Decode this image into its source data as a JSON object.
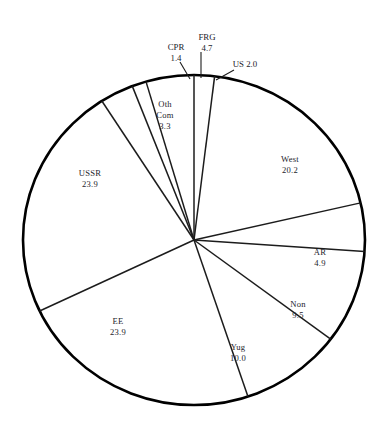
{
  "chart_data": {
    "type": "pie",
    "title": "",
    "subtitle": "",
    "xlabel": "",
    "ylabel": "",
    "units": "percent",
    "legend_position": "none",
    "grid": false,
    "start_angle_deg": 0,
    "direction": "clockwise",
    "categories": [
      "US",
      "West",
      "AR",
      "Non",
      "Yug",
      "EE",
      "USSR",
      "Oth Com",
      "CPR",
      "FRG"
    ],
    "values": [
      2.0,
      20.2,
      4.9,
      9.5,
      10.0,
      23.9,
      23.9,
      3.3,
      1.4,
      4.7
    ],
    "slices": [
      {
        "id": "us",
        "label": "US 2.0",
        "name": "US",
        "value": "2.0",
        "value_num": 2.0,
        "label_style": "callout-inline",
        "label_x": 245,
        "label_y": 65,
        "leader": {
          "x1": 234,
          "y1": 70,
          "x2": 216,
          "y2": 80
        }
      },
      {
        "id": "west",
        "label": "West",
        "name": "West",
        "value": "20.2",
        "value_num": 20.2,
        "label_style": "inside",
        "label_x": 290,
        "label_y": 160
      },
      {
        "id": "ar",
        "label": "AR",
        "name": "AR",
        "value": "4.9",
        "value_num": 4.9,
        "label_style": "inside",
        "label_x": 320,
        "label_y": 253
      },
      {
        "id": "non",
        "label": "Non",
        "name": "Non",
        "value": "9.5",
        "value_num": 9.5,
        "label_style": "inside",
        "label_x": 298,
        "label_y": 305
      },
      {
        "id": "yug",
        "label": "Yug",
        "name": "Yug",
        "value": "10.0",
        "value_num": 10.0,
        "label_style": "inside",
        "label_x": 238,
        "label_y": 348
      },
      {
        "id": "ee",
        "label": "EE",
        "name": "EE",
        "value": "23.9",
        "value_num": 23.9,
        "label_style": "inside",
        "label_x": 118,
        "label_y": 322
      },
      {
        "id": "ussr",
        "label": "USSR",
        "name": "USSR",
        "value": "23.9",
        "value_num": 23.9,
        "label_style": "inside",
        "label_x": 90,
        "label_y": 174
      },
      {
        "id": "oth-com",
        "label": "Oth Com",
        "name": "Oth Com",
        "line1": "Oth",
        "line2": "Com",
        "value": "3.3",
        "value_num": 3.3,
        "label_style": "inside-three-line",
        "label_x": 165,
        "label_y": 105
      },
      {
        "id": "cpr",
        "label": "CPR",
        "name": "CPR",
        "value": "1.4",
        "value_num": 1.4,
        "label_style": "callout",
        "label_x": 176,
        "label_y": 48,
        "leader": {
          "x1": 180,
          "y1": 62,
          "x2": 190,
          "y2": 79
        }
      },
      {
        "id": "frg",
        "label": "FRG",
        "name": "FRG",
        "value": "4.7",
        "value_num": 4.7,
        "label_style": "callout",
        "label_x": 207,
        "label_y": 38,
        "leader": {
          "x1": 201,
          "y1": 52,
          "x2": 201,
          "y2": 78
        }
      }
    ],
    "total": "103.8",
    "colors": {
      "slice_fill": "#ffffff",
      "outline": "#000000",
      "spoke": "#1c1c1c",
      "text": "#23232b",
      "background": "#ffffff"
    }
  },
  "geometry": {
    "cx": 194,
    "cy": 240,
    "rx": 171,
    "ry": 165
  }
}
